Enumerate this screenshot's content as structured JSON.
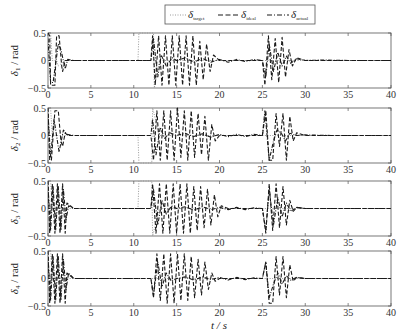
{
  "chart_data": {
    "type": "line",
    "xlabel": "t / s",
    "xlim": [
      0,
      40
    ],
    "xticks": [
      0,
      5,
      10,
      15,
      20,
      25,
      30,
      35,
      40
    ],
    "ylim": [
      -0.5,
      0.5
    ],
    "yticks": [
      -0.5,
      0,
      0.5
    ],
    "grid": false,
    "legend": {
      "position": "top-center",
      "entries": [
        {
          "label": "δ",
          "sub": "target",
          "style": "dotted",
          "color": "#9a9a9a"
        },
        {
          "label": "δ",
          "sub": "ideal",
          "style": "dashed",
          "color": "#1a1a1a"
        },
        {
          "label": "δ",
          "sub": "actual",
          "style": "dashdot",
          "color": "#1a1a1a"
        }
      ]
    },
    "panels": [
      {
        "ylabel": "δ1 / rad",
        "ylabel_main": "δ",
        "ylabel_sub": "1",
        "ylabel_unit": " / rad",
        "series": [
          {
            "name": "dotted",
            "x": [
              0,
              0.3,
              0.5,
              1.0,
              1.2,
              2,
              10.5,
              10.6,
              12.3,
              12.4,
              13,
              40
            ],
            "y": [
              0.5,
              0.5,
              0,
              0,
              -0.1,
              0,
              0,
              0.5,
              0.5,
              -0.5,
              0,
              0
            ]
          },
          {
            "name": "dashed",
            "x": [
              0,
              0.2,
              0.3,
              0.6,
              0.8,
              1.0,
              1.2,
              1.3,
              1.6,
              1.7,
              2.0,
              2.3,
              3,
              12,
              12.2,
              12.5,
              12.9,
              13.3,
              13.7,
              14.1,
              14.5,
              14.9,
              15.3,
              15.7,
              16.1,
              16.5,
              16.9,
              17.3,
              17.7,
              18.1,
              18.5,
              18.9,
              19.3,
              20,
              25,
              25.3,
              25.7,
              26.1,
              26.5,
              26.9,
              27.3,
              27.7,
              28.1,
              28.5,
              29,
              30,
              40
            ],
            "y": [
              0.5,
              0.45,
              -0.45,
              -0.45,
              -0.45,
              0.45,
              0.45,
              0.45,
              -0.1,
              -0.2,
              0,
              0,
              0,
              0,
              0.45,
              -0.45,
              0.45,
              -0.45,
              0.45,
              -0.45,
              0.45,
              -0.45,
              0.45,
              -0.45,
              0.45,
              -0.45,
              0.45,
              -0.45,
              0.35,
              -0.35,
              0.3,
              -0.2,
              0.1,
              0,
              0,
              -0.45,
              0.45,
              -0.35,
              0.4,
              -0.4,
              0.42,
              -0.3,
              0.2,
              -0.1,
              0.05,
              0,
              0
            ]
          },
          {
            "name": "dashdot",
            "x": [
              0,
              0.3,
              0.6,
              1.2,
              1.5,
              2.0,
              2.3,
              3,
              12,
              12.3,
              12.8,
              13.2,
              13.8,
              14.5,
              15,
              16,
              17,
              18,
              19,
              20,
              21,
              22,
              23,
              24,
              25,
              25.4,
              25.8,
              26.3,
              26.8,
              27.3,
              27.8,
              28.3,
              29,
              30,
              32,
              35,
              40
            ],
            "y": [
              0.4,
              -0.4,
              -0.4,
              0.3,
              0.2,
              -0.15,
              0.02,
              0,
              0,
              0.4,
              -0.3,
              0.1,
              -0.1,
              0.05,
              0,
              0.05,
              -0.03,
              0.04,
              -0.03,
              0.02,
              -0.03,
              0.02,
              -0.02,
              0.02,
              0,
              -0.3,
              0.3,
              -0.2,
              0.15,
              -0.1,
              0.08,
              -0.05,
              0.03,
              0,
              0.01,
              0,
              0
            ]
          }
        ]
      },
      {
        "ylabel": "δ2 / rad",
        "ylabel_main": "δ",
        "ylabel_sub": "2",
        "ylabel_unit": " / rad",
        "series": [
          {
            "name": "dotted",
            "x": [
              0,
              0.3,
              0.5,
              1.0,
              2,
              10.5,
              10.6,
              12.1,
              12.2,
              13,
              40
            ],
            "y": [
              0.5,
              0.5,
              0,
              0,
              0,
              0,
              -0.5,
              -0.5,
              0.5,
              0,
              0
            ]
          },
          {
            "name": "dashed",
            "x": [
              0,
              0.2,
              0.4,
              0.8,
              1.2,
              1.5,
              1.7,
              2.0,
              2.3,
              3,
              12,
              12.3,
              12.7,
              13.1,
              13.5,
              13.9,
              14.3,
              14.7,
              15.1,
              15.5,
              15.9,
              16.3,
              16.7,
              17.1,
              17.5,
              17.9,
              18.3,
              18.7,
              19.1,
              19.5,
              20,
              25,
              25.4,
              25.8,
              26.2,
              26.6,
              27.0,
              27.4,
              27.8,
              28.2,
              28.6,
              29,
              30,
              40
            ],
            "y": [
              0.5,
              -0.45,
              -0.45,
              0.45,
              0.45,
              -0.1,
              -0.2,
              0.05,
              0,
              0,
              0,
              -0.45,
              0.45,
              -0.45,
              0.45,
              -0.45,
              0.45,
              -0.45,
              0.5,
              -0.4,
              0.45,
              -0.45,
              0.45,
              -0.4,
              0.4,
              -0.35,
              0.35,
              -0.45,
              0.2,
              -0.1,
              0,
              0,
              0.45,
              -0.45,
              -0.45,
              0.4,
              -0.2,
              0.4,
              -0.45,
              0.35,
              -0.1,
              0.05,
              0,
              0
            ]
          },
          {
            "name": "dashdot",
            "x": [
              0,
              0.3,
              0.7,
              1.3,
              1.8,
              2.2,
              3,
              12,
              12.2,
              12.6,
              13.1,
              13.6,
              14.2,
              15,
              16,
              17,
              18,
              19,
              20,
              21,
              22,
              23,
              24,
              25,
              25.3,
              25.8,
              26.3,
              26.7,
              27.2,
              27.7,
              28.2,
              29,
              30,
              33,
              40
            ],
            "y": [
              0.4,
              -0.4,
              0.3,
              -0.3,
              0.1,
              0.02,
              0,
              0,
              0.3,
              -0.35,
              0.15,
              -0.05,
              0.05,
              0,
              0.04,
              -0.02,
              0.03,
              -0.03,
              0.02,
              -0.02,
              0.02,
              -0.02,
              0.02,
              0,
              0.45,
              -0.45,
              -0.1,
              0.1,
              0.05,
              -0.1,
              0.04,
              0,
              0.01,
              0,
              0
            ]
          }
        ]
      },
      {
        "ylabel": "δ3 / rad",
        "ylabel_main": "δ",
        "ylabel_sub": "3",
        "ylabel_unit": " / rad",
        "series": [
          {
            "name": "dotted",
            "x": [
              0,
              0.3,
              0.5,
              1.0,
              2,
              10.5,
              10.6,
              12.1,
              12.2,
              13,
              40
            ],
            "y": [
              0.5,
              0.5,
              0,
              0,
              0,
              0,
              0.5,
              0.5,
              -0.5,
              0,
              0
            ]
          },
          {
            "name": "dashed",
            "x": [
              0,
              0.2,
              0.5,
              0.8,
              1.1,
              1.4,
              1.7,
              2.0,
              2.2,
              3,
              12,
              12.2,
              12.6,
              13.0,
              13.4,
              13.8,
              14.2,
              14.6,
              15.0,
              15.4,
              15.8,
              16.2,
              16.6,
              17.0,
              17.4,
              17.8,
              18.2,
              18.6,
              19.0,
              19.4,
              19.8,
              20.2,
              21,
              25,
              25.4,
              25.8,
              26.2,
              26.6,
              27.0,
              27.4,
              27.8,
              28.2,
              28.6,
              29,
              30,
              40
            ],
            "y": [
              0.5,
              -0.45,
              0.45,
              -0.45,
              0.45,
              -0.45,
              0.45,
              -0.45,
              0.1,
              0,
              0,
              0.45,
              -0.45,
              0.45,
              -0.45,
              0.45,
              -0.45,
              0.45,
              -0.45,
              0.45,
              -0.45,
              0.45,
              -0.45,
              0.4,
              -0.4,
              0.4,
              -0.35,
              0.35,
              -0.3,
              0.25,
              -0.15,
              0.05,
              0,
              0,
              -0.45,
              0.45,
              -0.4,
              0.45,
              -0.35,
              0.4,
              -0.3,
              0.15,
              -0.05,
              0.02,
              0,
              0
            ]
          },
          {
            "name": "dashdot",
            "x": [
              0,
              0.3,
              0.6,
              0.9,
              1.2,
              1.5,
              1.8,
              2.1,
              2.4,
              3,
              12,
              12.3,
              12.8,
              13.3,
              13.8,
              14.4,
              15,
              16,
              17,
              18,
              19,
              20,
              21,
              22,
              23,
              24,
              25,
              25.4,
              25.8,
              26.3,
              26.8,
              27.3,
              27.8,
              28.3,
              29,
              30,
              34,
              40
            ],
            "y": [
              0.4,
              -0.4,
              0.4,
              -0.4,
              0.4,
              -0.4,
              0.35,
              -0.2,
              0.05,
              0,
              0,
              0.35,
              -0.3,
              0.15,
              -0.1,
              0.05,
              0,
              0.03,
              -0.03,
              0.03,
              -0.02,
              0.02,
              -0.02,
              0.02,
              -0.02,
              0.01,
              0,
              -0.4,
              0.35,
              -0.3,
              0.2,
              -0.15,
              0.1,
              -0.05,
              0.02,
              0,
              0,
              0
            ]
          }
        ]
      },
      {
        "ylabel": "δ4 / rad",
        "ylabel_main": "δ",
        "ylabel_sub": "4",
        "ylabel_unit": " / rad",
        "series": [
          {
            "name": "dotted",
            "x": [
              0,
              0.3,
              0.5,
              1.0,
              2,
              40
            ],
            "y": [
              0.5,
              0.5,
              0,
              0,
              0,
              0
            ]
          },
          {
            "name": "dashed",
            "x": [
              0,
              0.2,
              0.5,
              0.8,
              1.1,
              1.4,
              1.7,
              2.0,
              2.2,
              3,
              12,
              12.3,
              12.7,
              13.1,
              13.5,
              13.9,
              14.3,
              14.7,
              15.1,
              15.5,
              15.9,
              16.3,
              16.7,
              17.1,
              17.5,
              17.9,
              18.3,
              18.7,
              19.1,
              19.5,
              20,
              25,
              25.4,
              25.8,
              26.2,
              26.6,
              27.0,
              27.4,
              27.8,
              28.2,
              28.6,
              29,
              30,
              40
            ],
            "y": [
              0.5,
              -0.45,
              0.45,
              -0.45,
              0.45,
              -0.45,
              0.45,
              -0.45,
              0.1,
              0,
              0,
              -0.35,
              0.45,
              -0.4,
              0.45,
              -0.45,
              0.45,
              -0.45,
              0.45,
              -0.4,
              0.45,
              -0.4,
              0.4,
              -0.35,
              0.35,
              -0.3,
              0.3,
              -0.2,
              0.1,
              -0.05,
              0,
              0,
              0.3,
              -0.45,
              -0.45,
              0.4,
              -0.3,
              0.4,
              -0.35,
              0.25,
              -0.05,
              0.02,
              0,
              0
            ]
          },
          {
            "name": "dashdot",
            "x": [
              0,
              0.3,
              0.6,
              0.9,
              1.2,
              1.5,
              1.8,
              2.1,
              2.4,
              3,
              12,
              12.3,
              12.8,
              13.3,
              13.8,
              14.4,
              15,
              16,
              17,
              18,
              19,
              20,
              21,
              22,
              23,
              24,
              25,
              25.4,
              25.8,
              26.3,
              26.8,
              27.3,
              27.8,
              28.3,
              29,
              30,
              34,
              40
            ],
            "y": [
              0.4,
              -0.4,
              0.4,
              -0.4,
              0.4,
              -0.4,
              0.35,
              -0.2,
              0.1,
              0,
              0,
              -0.3,
              0.3,
              -0.15,
              0.1,
              -0.05,
              0,
              0.03,
              -0.03,
              0.03,
              -0.02,
              0.02,
              -0.03,
              0.02,
              -0.02,
              0.01,
              0,
              0.3,
              -0.35,
              -0.1,
              0.1,
              -0.1,
              0.05,
              -0.03,
              0.02,
              0,
              0,
              0
            ]
          }
        ]
      }
    ]
  },
  "colors": {
    "frame": "#555555",
    "dotted": "#9a9a9a",
    "solid": "#1a1a1a"
  }
}
